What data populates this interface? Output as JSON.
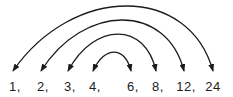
{
  "diagram": {
    "background": "#ffffff",
    "stroke_color": "#1c1c1c",
    "text_color": "#1c1c1c",
    "font_size": 13,
    "canvas": {
      "width": 233,
      "height": 97
    },
    "numbers": [
      {
        "label": "1,",
        "x": 13
      },
      {
        "label": "2,",
        "x": 41
      },
      {
        "label": "3,",
        "x": 68
      },
      {
        "label": "4,",
        "x": 93
      },
      {
        "label": "6,",
        "x": 131
      },
      {
        "label": "8,",
        "x": 156
      },
      {
        "label": "12,",
        "x": 184
      },
      {
        "label": "24",
        "x": 213
      }
    ],
    "baseline_y": 91,
    "arrow_tip_y": 71,
    "arcs": [
      {
        "from_index": 0,
        "to_index": 7,
        "from_label": "1",
        "to_label": "24",
        "peak_y": 6
      },
      {
        "from_index": 1,
        "to_index": 6,
        "from_label": "2",
        "to_label": "12",
        "peak_y": 20
      },
      {
        "from_index": 2,
        "to_index": 5,
        "from_label": "3",
        "to_label": "8",
        "peak_y": 34
      },
      {
        "from_index": 3,
        "to_index": 4,
        "from_label": "4",
        "to_label": "6",
        "peak_y": 52
      }
    ]
  }
}
